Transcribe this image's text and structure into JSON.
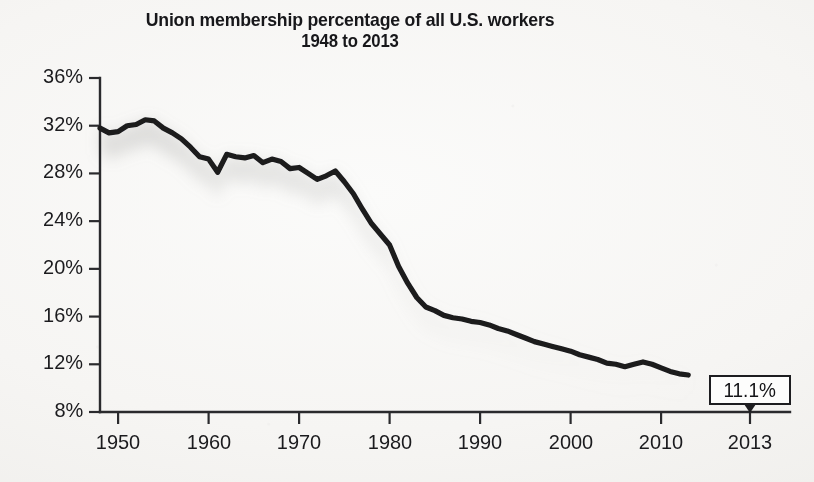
{
  "chart_data": {
    "type": "line",
    "title": "Union membership percentage of all U.S. workers",
    "subtitle": "1948 to 2013",
    "xlabel": "",
    "ylabel": "",
    "xlim": [
      1948,
      2013
    ],
    "ylim": [
      8,
      36
    ],
    "grid": false,
    "legend": null,
    "y_tick_labels": [
      "36%",
      "32%",
      "28%",
      "24%",
      "20%",
      "16%",
      "12%",
      "8%"
    ],
    "y_ticks": [
      36,
      32,
      28,
      24,
      20,
      16,
      12,
      8
    ],
    "x_tick_labels": [
      "1950",
      "1960",
      "1970",
      "1980",
      "1990",
      "2000",
      "2010",
      "2013"
    ],
    "x_ticks": [
      1950,
      1960,
      1970,
      1980,
      1990,
      2000,
      2010,
      2013
    ],
    "series": [
      {
        "name": "Union membership percentage",
        "color": "#1a1a1d",
        "x": [
          1948,
          1949,
          1950,
          1951,
          1952,
          1953,
          1954,
          1955,
          1956,
          1957,
          1958,
          1959,
          1960,
          1961,
          1962,
          1963,
          1964,
          1965,
          1966,
          1967,
          1968,
          1969,
          1970,
          1971,
          1972,
          1973,
          1974,
          1975,
          1976,
          1977,
          1978,
          1979,
          1980,
          1981,
          1982,
          1983,
          1984,
          1985,
          1986,
          1987,
          1988,
          1989,
          1990,
          1991,
          1992,
          1993,
          1994,
          1995,
          1996,
          1997,
          1998,
          1999,
          2000,
          2001,
          2002,
          2003,
          2004,
          2005,
          2006,
          2007,
          2008,
          2009,
          2010,
          2011,
          2012,
          2013
        ],
        "values": [
          31.8,
          31.4,
          31.5,
          32.0,
          32.1,
          32.5,
          32.4,
          31.8,
          31.4,
          30.9,
          30.2,
          29.4,
          29.2,
          28.1,
          29.6,
          29.4,
          29.3,
          29.5,
          28.9,
          29.2,
          29.0,
          28.4,
          28.5,
          28.0,
          27.5,
          27.8,
          28.2,
          27.3,
          26.3,
          25.0,
          23.8,
          22.9,
          22.0,
          20.2,
          18.8,
          17.6,
          16.8,
          16.5,
          16.1,
          15.9,
          15.8,
          15.6,
          15.5,
          15.3,
          15.0,
          14.8,
          14.5,
          14.2,
          13.9,
          13.7,
          13.5,
          13.3,
          13.1,
          12.8,
          12.6,
          12.4,
          12.1,
          12.0,
          11.8,
          12.0,
          12.2,
          12.0,
          11.7,
          11.4,
          11.2,
          11.1
        ],
        "endpoint_annotation": "11.1%"
      }
    ],
    "annotations": [
      {
        "id": "endpoint-callout",
        "text": "11.1%",
        "year": 2013,
        "value": 11.1,
        "style": "boxed-with-downward-pointer"
      }
    ],
    "colors": {
      "line": "#1a1a1d",
      "axis": "#2a2a2d",
      "text": "#1b1b1e",
      "background": "#f7f6f4",
      "callout_border": "#1d1d20",
      "callout_fill": "#fdfdfc"
    }
  }
}
